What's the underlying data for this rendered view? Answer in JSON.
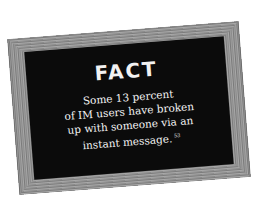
{
  "card": {
    "title": "FACT",
    "lines": [
      "Some 13 percent",
      "of IM users have broken",
      "up with someone via an",
      "instant message."
    ],
    "footnote": "53"
  },
  "colors": {
    "background": "#ffffff",
    "board": "#0b0b0b",
    "frame": "#8c8c8c",
    "text": "#f4f4f4"
  }
}
